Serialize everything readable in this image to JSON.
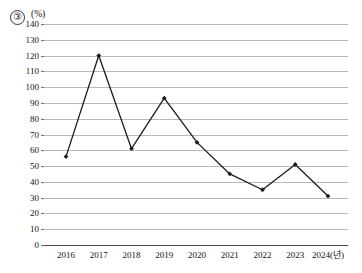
{
  "header": {
    "item_number": "③",
    "unit_label": "(%)"
  },
  "chart_data": {
    "type": "line",
    "title": "",
    "xlabel": "",
    "ylabel": "",
    "unit": "(%)",
    "x_axis_suffix": "(년)",
    "categories": [
      "2016",
      "2017",
      "2018",
      "2019",
      "2020",
      "2021",
      "2022",
      "2023",
      "2024"
    ],
    "tick_labels_x": [
      "2016",
      "2017",
      "2018",
      "2019",
      "2020",
      "2021",
      "2022",
      "2023",
      "2024(년)"
    ],
    "values": [
      56,
      120,
      61,
      93,
      65,
      45,
      35,
      51,
      31
    ],
    "ylim": [
      0,
      140
    ],
    "y_tick_step": 10,
    "tick_labels_y": [
      "0",
      "10",
      "20",
      "30",
      "40",
      "50",
      "60",
      "70",
      "80",
      "90",
      "100",
      "110",
      "120",
      "130",
      "140"
    ],
    "grid": "horizontal",
    "legend": "none",
    "marker": "diamond",
    "line_color": "#1c1c1c",
    "grid_color": "#b9b9b9",
    "axis_color": "#4a4a4a"
  }
}
